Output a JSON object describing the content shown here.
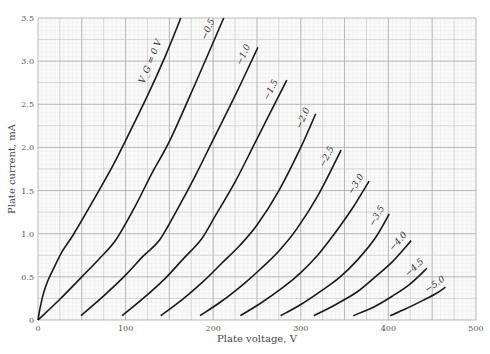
{
  "chart_data": {
    "type": "line",
    "title": "",
    "xlabel": "Plate voltage, V",
    "ylabel": "Plate current, mA",
    "xlim": [
      0,
      500
    ],
    "ylim": [
      0,
      3.5
    ],
    "x_ticks": [
      "0",
      "100",
      "200",
      "300",
      "400",
      "500"
    ],
    "y_ticks": [
      "0",
      "0.5",
      "1.0",
      "1.5",
      "2.0",
      "2.5",
      "3.0",
      "3.5"
    ],
    "grid": true,
    "legend": "inline curve labels",
    "series": [
      {
        "name": "V_G = 0 V",
        "label": "V_G = 0 V",
        "points": [
          [
            0,
            0
          ],
          [
            2,
            0.12
          ],
          [
            6,
            0.3
          ],
          [
            11,
            0.45
          ],
          [
            17,
            0.58
          ],
          [
            28,
            0.8
          ],
          [
            41,
            1.0
          ],
          [
            64,
            1.4
          ],
          [
            85,
            1.78
          ],
          [
            100,
            2.08
          ],
          [
            125,
            2.6
          ],
          [
            145,
            3.05
          ],
          [
            163,
            3.5
          ]
        ]
      },
      {
        "name": "-0.5",
        "label": "−0.5",
        "points": [
          [
            0,
            0
          ],
          [
            25,
            0.24
          ],
          [
            50,
            0.5
          ],
          [
            70,
            0.71
          ],
          [
            89,
            0.93
          ],
          [
            110,
            1.3
          ],
          [
            130,
            1.7
          ],
          [
            151,
            2.09
          ],
          [
            180,
            2.75
          ],
          [
            212,
            3.5
          ]
        ]
      },
      {
        "name": "-1.0",
        "label": "−1.0",
        "points": [
          [
            49,
            0.05
          ],
          [
            75,
            0.28
          ],
          [
            100,
            0.52
          ],
          [
            120,
            0.74
          ],
          [
            139,
            0.93
          ],
          [
            160,
            1.3
          ],
          [
            180,
            1.68
          ],
          [
            200,
            2.09
          ],
          [
            225,
            2.6
          ],
          [
            251,
            3.16
          ]
        ]
      },
      {
        "name": "-1.5",
        "label": "−1.5",
        "points": [
          [
            96,
            0.05
          ],
          [
            120,
            0.25
          ],
          [
            145,
            0.48
          ],
          [
            165,
            0.7
          ],
          [
            186,
            0.93
          ],
          [
            202,
            1.2
          ],
          [
            225,
            1.6
          ],
          [
            250,
            2.1
          ],
          [
            284,
            2.78
          ]
        ]
      },
      {
        "name": "-2.0",
        "label": "−2.0",
        "points": [
          [
            140,
            0.05
          ],
          [
            165,
            0.24
          ],
          [
            190,
            0.46
          ],
          [
            210,
            0.66
          ],
          [
            230,
            0.86
          ],
          [
            250,
            1.1
          ],
          [
            275,
            1.5
          ],
          [
            300,
            2.0
          ],
          [
            317,
            2.39
          ]
        ]
      },
      {
        "name": "-2.5",
        "label": "−2.5",
        "points": [
          [
            185,
            0.05
          ],
          [
            210,
            0.22
          ],
          [
            235,
            0.42
          ],
          [
            255,
            0.6
          ],
          [
            275,
            0.8
          ],
          [
            295,
            1.05
          ],
          [
            320,
            1.45
          ],
          [
            346,
            1.97
          ]
        ]
      },
      {
        "name": "-3.0",
        "label": "−3.0",
        "points": [
          [
            231,
            0.05
          ],
          [
            255,
            0.2
          ],
          [
            280,
            0.38
          ],
          [
            300,
            0.55
          ],
          [
            320,
            0.76
          ],
          [
            337,
            0.98
          ],
          [
            358,
            1.28
          ],
          [
            378,
            1.61
          ]
        ]
      },
      {
        "name": "-3.5",
        "label": "−3.5",
        "points": [
          [
            277,
            0.05
          ],
          [
            300,
            0.18
          ],
          [
            325,
            0.35
          ],
          [
            345,
            0.5
          ],
          [
            365,
            0.7
          ],
          [
            385,
            0.95
          ],
          [
            401,
            1.23
          ]
        ]
      },
      {
        "name": "-4.0",
        "label": "−4.0",
        "points": [
          [
            315,
            0.05
          ],
          [
            340,
            0.18
          ],
          [
            365,
            0.33
          ],
          [
            385,
            0.5
          ],
          [
            405,
            0.68
          ],
          [
            426,
            0.92
          ]
        ]
      },
      {
        "name": "-4.5",
        "label": "−4.5",
        "points": [
          [
            360,
            0.05
          ],
          [
            385,
            0.16
          ],
          [
            405,
            0.28
          ],
          [
            425,
            0.42
          ],
          [
            444,
            0.6
          ]
        ]
      },
      {
        "name": "-5.0",
        "label": "−5.0",
        "points": [
          [
            402,
            0.05
          ],
          [
            420,
            0.13
          ],
          [
            440,
            0.23
          ],
          [
            455,
            0.31
          ],
          [
            465,
            0.38
          ]
        ]
      }
    ]
  },
  "labels": {
    "xlabel": "Plate voltage, V",
    "ylabel": "Plate current, mA"
  }
}
